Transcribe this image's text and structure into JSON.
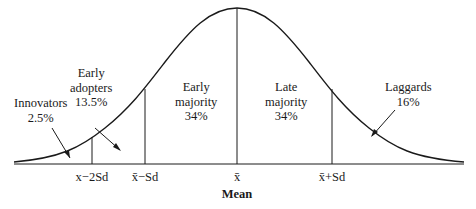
{
  "diagram": {
    "curve_color": "#1a1a1a",
    "categories": [
      {
        "name": "Innovators",
        "percent": "2.5%"
      },
      {
        "name": "Early adopters",
        "name_line1": "Early",
        "name_line2": "adopters",
        "percent": "13.5%"
      },
      {
        "name": "Early majority",
        "name_line1": "Early",
        "name_line2": "majority",
        "percent": "34%"
      },
      {
        "name": "Late majority",
        "name_line1": "Late",
        "name_line2": "majority",
        "percent": "34%"
      },
      {
        "name": "Laggards",
        "percent": "16%"
      }
    ],
    "axis_ticks": [
      "x−2Sd",
      "x̄−Sd",
      "x̄",
      "x̄+Sd"
    ],
    "axis_label": "Mean"
  }
}
